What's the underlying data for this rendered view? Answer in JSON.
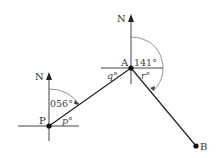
{
  "diagram": {
    "type": "bearings",
    "points": {
      "P": {
        "label": "P",
        "north_label": "N"
      },
      "A": {
        "label": "A",
        "north_label": "N"
      },
      "B": {
        "label": "B"
      }
    },
    "angles": {
      "p_bearing": "056°",
      "a_bearing": "141°",
      "p_unknown": "p°",
      "q_unknown": "q°",
      "r_unknown": "r°"
    },
    "segments": [
      {
        "from": "P",
        "to": "A"
      },
      {
        "from": "A",
        "to": "B"
      }
    ],
    "colors": {
      "line": "#222222",
      "arc": "#777777",
      "text": "#333333"
    }
  }
}
